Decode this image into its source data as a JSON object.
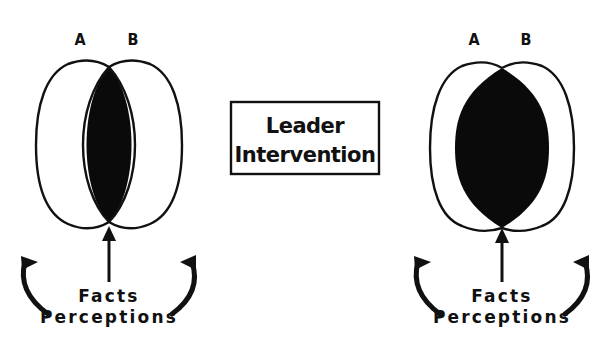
{
  "diagram": {
    "left_panel": {
      "label_a": "A",
      "label_b": "B",
      "caption_line1": "Facts",
      "caption_line2": "Perceptions",
      "overlap": "small"
    },
    "center_box": {
      "line1": "Leader",
      "line2": "Intervention"
    },
    "right_panel": {
      "label_a": "A",
      "label_b": "B",
      "caption_line1": "Facts",
      "caption_line2": "Perceptions",
      "overlap": "large"
    },
    "colors": {
      "ink": "#111111",
      "background": "#ffffff"
    }
  }
}
